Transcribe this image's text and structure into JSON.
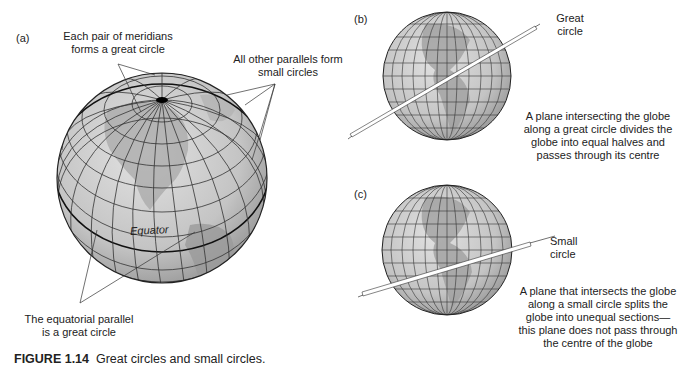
{
  "figure": {
    "number": "FIGURE 1.14",
    "title": "Great circles and small circles."
  },
  "panel_a": {
    "letter": "(a)",
    "meridians_label_line1": "Each pair of meridians",
    "meridians_label_line2": "forms a great circle",
    "parallels_label_line1": "All other parallels form",
    "parallels_label_line2": "small circles",
    "equator_label": "Equator",
    "equatorial_label_line1": "The equatorial parallel",
    "equatorial_label_line2": "is a great circle"
  },
  "panel_b": {
    "letter": "(b)",
    "plane_label_line1": "Great",
    "plane_label_line2": "circle",
    "desc_line1": "A plane intersecting the globe",
    "desc_line2": "along a great circle divides the",
    "desc_line3": "globe into equal halves and",
    "desc_line4": "passes through its centre"
  },
  "panel_c": {
    "letter": "(c)",
    "plane_label_line1": "Small",
    "plane_label_line2": "circle",
    "desc_line1": "A plane that intersects the globe",
    "desc_line2": "along a small circle splits the",
    "desc_line3": "globe into unequal sections—",
    "desc_line4": "this plane does not pass through",
    "desc_line5": "the centre of the globe"
  },
  "colors": {
    "globe_fill": "#c8c8c8",
    "grid_line": "#333333",
    "land": "#9a9a9a",
    "text": "#222222"
  }
}
